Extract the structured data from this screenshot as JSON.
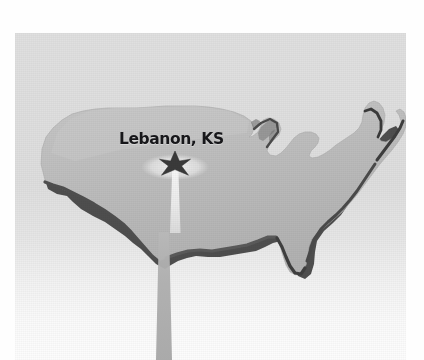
{
  "figure": {
    "title": "Lebanon, KS",
    "marker_label": "Lebanon, KS",
    "marker_kind": "star",
    "beam_kind": "light-beam",
    "colors": {
      "page_background": "#fefefe",
      "panel_background": "#e0e0e0",
      "panel_background_bottom": "#fdfdfd",
      "land_fill": "#b9b9b9",
      "land_fill_highlight": "#c8c8c8",
      "land_edge_shadow": "#4a4a4a",
      "label_text": "#17171a",
      "marker_fill": "#3a3a3a",
      "halo_fill": "#efefef",
      "beam_upper": "#f5f5f5",
      "beam_lower": "#adadad"
    },
    "panel": {
      "x": 15,
      "y": 33,
      "width": 391,
      "height": 327
    },
    "marker_position": {
      "x": 175,
      "y": 162
    }
  },
  "map_data": {
    "type": "outline-map",
    "region": "United States (contiguous 48 states)",
    "projection_style": "simplified silhouette with drop-shadow extrusion",
    "annotations": [
      {
        "name": "Lebanon, KS",
        "symbol": "star",
        "note": "geographic center marker",
        "label_text": "Lebanon, KS"
      }
    ],
    "legend": [],
    "grid": false
  }
}
